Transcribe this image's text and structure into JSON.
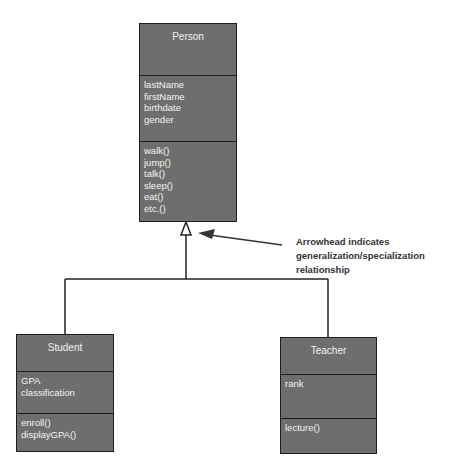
{
  "diagram": {
    "type": "UML class diagram",
    "classes": [
      {
        "id": "person",
        "name": "Person",
        "attributes": [
          "lastName",
          "firstName",
          "birthdate",
          "gender"
        ],
        "operations": [
          "walk()",
          "jump()",
          "talk()",
          "sleep()",
          "eat()",
          "etc.()"
        ]
      },
      {
        "id": "student",
        "name": "Student",
        "attributes": [
          "GPA",
          "classification"
        ],
        "operations": [
          "enroll()",
          "displayGPA()"
        ]
      },
      {
        "id": "teacher",
        "name": "Teacher",
        "attributes": [
          "rank"
        ],
        "operations": [
          "lecture()"
        ]
      }
    ],
    "relationships": [
      {
        "type": "generalization",
        "parent": "Person",
        "children": [
          "Student",
          "Teacher"
        ]
      }
    ],
    "annotation": {
      "lines": [
        "Arrowhead indicates",
        "generalization/specialization",
        "relationship"
      ]
    },
    "colors": {
      "class_fill": "#6e6e6e",
      "class_border": "#1e1e1e",
      "class_text": "#f2f2f2",
      "annotation_text": "#333333"
    }
  }
}
